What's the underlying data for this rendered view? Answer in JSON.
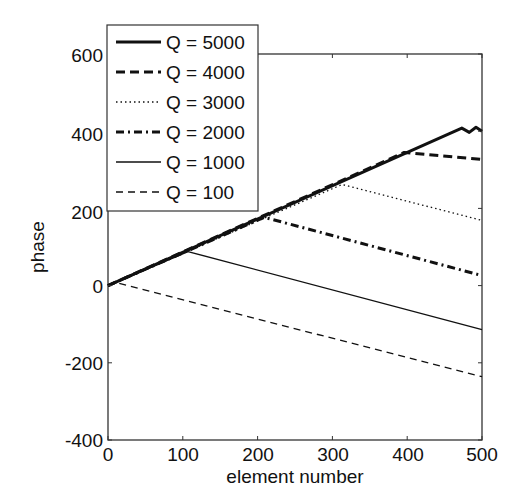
{
  "chart_data": {
    "type": "line",
    "title": "",
    "xlabel": "element number",
    "ylabel": "phase",
    "xlim": [
      0,
      500
    ],
    "ylim": [
      -400,
      600
    ],
    "xticks": [
      0,
      100,
      200,
      300,
      400,
      500
    ],
    "yticks": [
      -400,
      -200,
      0,
      200,
      400,
      600
    ],
    "grid": false,
    "legend_position": "upper left",
    "series": [
      {
        "name": "Q = 5000",
        "style": "solid-thick",
        "points": [
          [
            0,
            0
          ],
          [
            473,
            408
          ],
          [
            483,
            397
          ],
          [
            492,
            410
          ],
          [
            500,
            400
          ]
        ]
      },
      {
        "name": "Q = 4000",
        "style": "dashed-thick",
        "points": [
          [
            0,
            0
          ],
          [
            396,
            345
          ],
          [
            500,
            327
          ]
        ]
      },
      {
        "name": "Q = 3000",
        "style": "dotted",
        "points": [
          [
            0,
            0
          ],
          [
            313,
            262
          ],
          [
            500,
            169
          ]
        ]
      },
      {
        "name": "Q = 2000",
        "style": "dashdot-thick",
        "points": [
          [
            0,
            0
          ],
          [
            209,
            177
          ],
          [
            500,
            26
          ]
        ]
      },
      {
        "name": "Q = 1000",
        "style": "solid-thin",
        "points": [
          [
            0,
            0
          ],
          [
            107,
            88
          ],
          [
            500,
            -114
          ]
        ]
      },
      {
        "name": "Q = 100",
        "style": "dashed-thin",
        "points": [
          [
            0,
            0
          ],
          [
            10,
            8
          ],
          [
            500,
            -236
          ]
        ]
      }
    ]
  },
  "axes": {
    "xlabel": "element number",
    "ylabel": "phase",
    "xtick_labels": [
      "0",
      "100",
      "200",
      "300",
      "400",
      "500"
    ],
    "ytick_labels": [
      "-400",
      "-200",
      "0",
      "200",
      "400",
      "600"
    ]
  },
  "legend": {
    "items": [
      "Q = 5000",
      "Q = 4000",
      "Q = 3000",
      "Q = 2000",
      "Q = 1000",
      "Q = 100"
    ]
  },
  "colors": {
    "line": "#111111",
    "axis": "#333333",
    "background": "#ffffff"
  }
}
